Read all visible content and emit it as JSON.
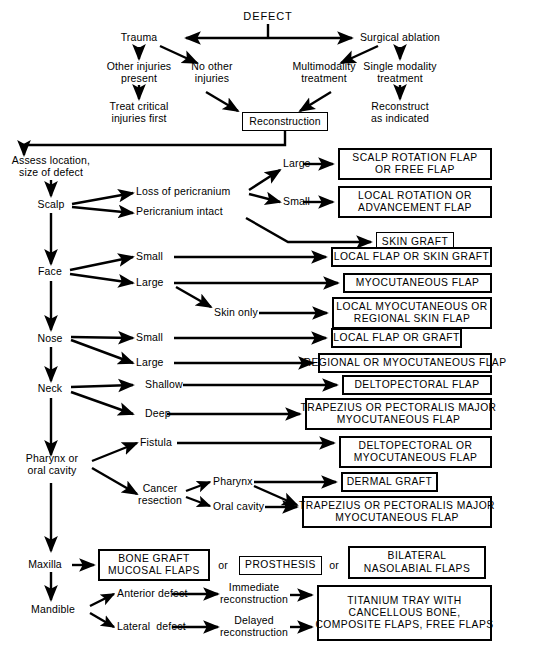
{
  "diagram": {
    "type": "flowchart",
    "root": "DEFECT",
    "nodes": {
      "defect": "DEFECT",
      "trauma": "Trauma",
      "surgical_ablation": "Surgical ablation",
      "other_injuries": "Other injuries\npresent",
      "no_other_injuries": "No other\ninjuries",
      "multimodality": "Multimodality\ntreatment",
      "single_modality": "Single modality\ntreatment",
      "treat_critical": "Treat critical\ninjuries first",
      "reconstruct_as_indicated": "Reconstruct\nas indicated",
      "reconstruction": "Reconstruction",
      "assess": "Assess location,\nsize of defect",
      "scalp": "Scalp",
      "face": "Face",
      "nose": "Nose",
      "neck": "Neck",
      "pharynx_oral": "Pharynx or\noral cavity",
      "maxilla": "Maxilla",
      "mandible": "Mandible",
      "loss_of_pericranium": "Loss of pericranium",
      "pericranium_intact": "Pericranium intact",
      "scalp_large": "Large",
      "scalp_small": "Small",
      "face_small": "Small",
      "face_large": "Large",
      "skin_only": "Skin only",
      "nose_small": "Small",
      "nose_large": "Large",
      "neck_shallow": "Shallow",
      "neck_deep": "Deep",
      "fistula": "Fistula",
      "cancer_resection": "Cancer\nresection",
      "cr_pharynx": "Pharynx",
      "cr_oral_cavity": "Oral cavity",
      "anterior_defect": "Anterior defect",
      "lateral_defect": "Lateral  defect",
      "immediate_reconstruction": "Immediate\nreconstruction",
      "delayed_reconstruction": "Delayed\nreconstruction",
      "or_1": "or",
      "or_2": "or"
    },
    "outcome_boxes": {
      "scalp_rotation": "SCALP ROTATION FLAP\nOR FREE FLAP",
      "local_rotation": "LOCAL ROTATION OR\nADVANCEMENT FLAP",
      "skin_graft": "SKIN GRAFT",
      "local_flap_or_skin_graft": "LOCAL FLAP OR SKIN GRAFT",
      "myocutaneous_flap": "MYOCUTANEOUS FLAP",
      "local_myocutaneous": "LOCAL MYOCUTANEOUS OR\nREGIONAL SKIN FLAP",
      "local_flap_or_graft": "LOCAL FLAP OR GRAFT",
      "regional_or_myocutaneous": "REGIONAL OR MYOCUTANEOUS FLAP",
      "deltopectoral_flap": "DELTOPECTORAL FLAP",
      "trapezius_neck": "TRAPEZIUS OR PECTORALIS MAJOR\nMYOCUTANEOUS FLAP",
      "deltopectoral_or_myo": "DELTOPECTORAL OR\nMYOCUTANEOUS FLAP",
      "dermal_graft": "DERMAL GRAFT",
      "trapezius_oral": "TRAPEZIUS OR PECTORALIS MAJOR\nMYOCUTANEOUS FLAP",
      "bone_graft": "BONE GRAFT\nMUCOSAL FLAPS",
      "prosthesis": "PROSTHESIS",
      "bilateral_nasolabial": "BILATERAL\nNASOLABIAL FLAPS",
      "titanium_tray": "TITANIUM TRAY WITH\nCANCELLOUS BONE,\nCOMPOSITE FLAPS, FREE FLAPS",
      "reconstruction_box": "Reconstruction"
    },
    "colors": {
      "ink": "#000000",
      "paper": "#ffffff"
    }
  }
}
